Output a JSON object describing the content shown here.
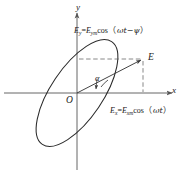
{
  "figure": {
    "axes": {
      "x_label": "x",
      "y_label": "y",
      "origin_label": "O"
    },
    "point_label": "E",
    "angle_label": "α",
    "equation_y": {
      "lhs_symbol": "E",
      "lhs_sub": "y",
      "equals": "=",
      "amp_symbol": "E",
      "amp_sub": "ym",
      "func": "cos",
      "open_paren": "（",
      "arg": "ωt−ψ",
      "close_paren": "）",
      "full_text": "Ey=Eymcos（ωt−ψ）"
    },
    "equation_x": {
      "lhs_symbol": "E",
      "lhs_sub": "x",
      "equals": "=",
      "amp_symbol": "E",
      "amp_sub": "xm",
      "func": "cos",
      "open_paren": "（",
      "arg": "ωt",
      "close_paren": "）",
      "full_text": "Ex=Exmcos（ωt）"
    },
    "caption": "",
    "colors": {
      "stroke": "#2a2a2a",
      "axis": "#555555",
      "dashed": "#6b6b6b",
      "text": "#1a1a1a",
      "background": "#ffffff"
    },
    "geometry": {
      "origin_x": 77,
      "origin_y": 93,
      "ellipse_rx": 62,
      "ellipse_ry": 26,
      "ellipse_rotation_deg": -56,
      "point_E_x": 143,
      "point_E_y": 59,
      "x_axis_start": 4,
      "x_axis_end": 178,
      "y_axis_top": 12,
      "y_axis_bottom": 170
    }
  }
}
